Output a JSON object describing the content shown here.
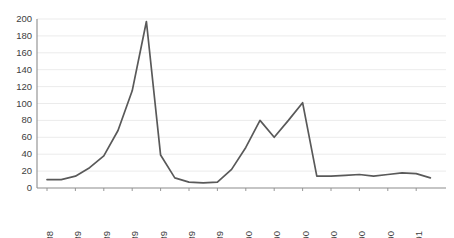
{
  "chart_data": {
    "type": "line",
    "title": "",
    "subtitle": "",
    "xlabel": "",
    "ylabel": "",
    "ylim": [
      0,
      200
    ],
    "ytick_step": 20,
    "yticks": [
      0,
      20,
      40,
      60,
      80,
      100,
      120,
      140,
      160,
      180,
      200
    ],
    "ytick_labels": [
      "0",
      "20",
      "40",
      "60",
      "80",
      "100",
      "120",
      "140",
      "160",
      "180",
      "200"
    ],
    "grid": "horizontal",
    "legend": "none",
    "line_color": "#595959",
    "gridline_color": "#e6e6e6",
    "axis_color": "#8c8c8c",
    "background_color": "#ffffff",
    "xtick_labels": [
      "Dec-88",
      "Feb-89",
      "Apr-89",
      "Jun-89",
      "Aug-89",
      "Oct-89",
      "Dec-89",
      "Feb-90",
      "Apr-90",
      "Jun-90",
      "Aug-90",
      "Oct-90",
      "Dec-90",
      "Feb-91"
    ],
    "xtick_label_rotation": -90,
    "x": [
      "Dec-88",
      "Jan-89",
      "Feb-89",
      "Mar-89",
      "Apr-89",
      "May-89",
      "Jun-89",
      "Jul-89",
      "Aug-89",
      "Sep-89",
      "Oct-89",
      "Nov-89",
      "Dec-89",
      "Jan-90",
      "Feb-90",
      "Mar-90",
      "Apr-90",
      "May-90",
      "Jun-90",
      "Jul-90",
      "Aug-90",
      "Sep-90",
      "Oct-90",
      "Nov-90",
      "Dec-90",
      "Jan-91",
      "Feb-91",
      "Mar-91"
    ],
    "values": [
      10,
      10,
      14,
      24,
      38,
      68,
      115,
      197,
      39,
      12,
      7,
      6,
      7,
      22,
      48,
      80,
      60,
      80,
      101,
      14,
      14,
      15,
      16,
      14,
      16,
      18,
      17,
      12
    ],
    "series": [
      {
        "name": "series-1",
        "values": [
          10,
          10,
          14,
          24,
          38,
          68,
          115,
          197,
          39,
          12,
          7,
          6,
          7,
          22,
          48,
          80,
          60,
          80,
          101,
          14,
          14,
          15,
          16,
          14,
          16,
          18,
          17,
          12
        ]
      }
    ],
    "points": [
      {
        "x": "Dec-88",
        "y": 10
      },
      {
        "x": "Jan-89",
        "y": 10
      },
      {
        "x": "Feb-89",
        "y": 14
      },
      {
        "x": "Mar-89",
        "y": 24
      },
      {
        "x": "Apr-89",
        "y": 38
      },
      {
        "x": "May-89",
        "y": 68
      },
      {
        "x": "Jun-89",
        "y": 115
      },
      {
        "x": "Jul-89",
        "y": 197
      },
      {
        "x": "Aug-89",
        "y": 39
      },
      {
        "x": "Sep-89",
        "y": 12
      },
      {
        "x": "Oct-89",
        "y": 7
      },
      {
        "x": "Nov-89",
        "y": 6
      },
      {
        "x": "Dec-89",
        "y": 7
      },
      {
        "x": "Jan-90",
        "y": 22
      },
      {
        "x": "Feb-90",
        "y": 48
      },
      {
        "x": "Mar-90",
        "y": 80
      },
      {
        "x": "Apr-90",
        "y": 60
      },
      {
        "x": "May-90",
        "y": 80
      },
      {
        "x": "Jun-90",
        "y": 101
      },
      {
        "x": "Jul-90",
        "y": 14
      },
      {
        "x": "Aug-90",
        "y": 14
      },
      {
        "x": "Sep-90",
        "y": 15
      },
      {
        "x": "Oct-90",
        "y": 16
      },
      {
        "x": "Nov-90",
        "y": 14
      },
      {
        "x": "Dec-90",
        "y": 16
      },
      {
        "x": "Jan-91",
        "y": 18
      },
      {
        "x": "Feb-91",
        "y": 17
      },
      {
        "x": "Mar-91",
        "y": 12
      }
    ],
    "annotations": []
  },
  "layout": {
    "plot_left": 37,
    "plot_right": 446,
    "plot_top": 19,
    "plot_bottom": 188,
    "x_first_tick": 47,
    "x_tick_spacing": 14.2
  }
}
